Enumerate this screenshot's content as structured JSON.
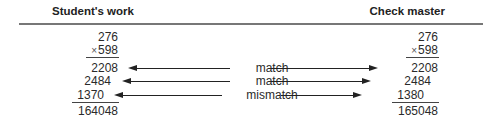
{
  "headers": {
    "left": "Student's work",
    "right": "Check master"
  },
  "student": {
    "multiplicand": "276",
    "operator": "×",
    "multiplier": "598",
    "partials": [
      "2208",
      "2484",
      "1370"
    ],
    "total": "164048"
  },
  "master": {
    "multiplicand": "276",
    "operator": "×",
    "multiplier": "598",
    "partials": [
      "2208",
      "2484",
      "1380"
    ],
    "total": "165048"
  },
  "comparisons": [
    {
      "label": "match"
    },
    {
      "label": "match"
    },
    {
      "label": "mismatch"
    }
  ]
}
